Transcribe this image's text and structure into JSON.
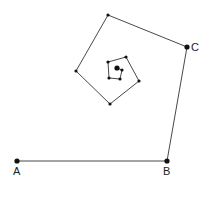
{
  "diagram": {
    "title": "",
    "stroke_color": "#333333",
    "point_color": "#111111",
    "labels": {
      "A": "A",
      "B": "B",
      "C": "C"
    },
    "polyline": [
      {
        "x": 17,
        "y": 161,
        "label": "A"
      },
      {
        "x": 167,
        "y": 161,
        "label": "B"
      },
      {
        "x": 187,
        "y": 47,
        "label": "C"
      },
      {
        "x": 108,
        "y": 15
      },
      {
        "x": 76,
        "y": 71
      },
      {
        "x": 110,
        "y": 104
      },
      {
        "x": 139,
        "y": 81
      },
      {
        "x": 126,
        "y": 57
      },
      {
        "x": 108,
        "y": 62
      },
      {
        "x": 109,
        "y": 78
      },
      {
        "x": 120,
        "y": 79
      },
      {
        "x": 122,
        "y": 70
      },
      {
        "x": 117,
        "y": 68
      }
    ]
  }
}
